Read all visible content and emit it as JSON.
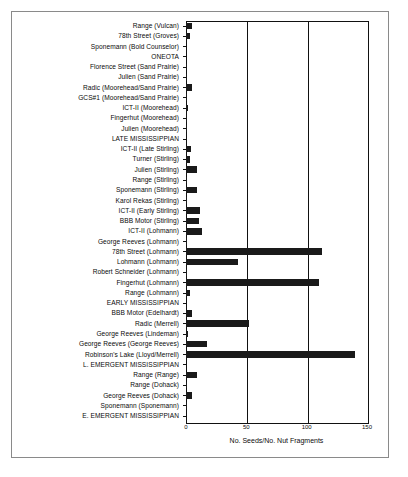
{
  "chart_data": {
    "type": "bar",
    "orientation": "horizontal",
    "title": "",
    "xlabel": "No. Seeds/No. Nut Fragments",
    "ylabel": "",
    "xlim": [
      0,
      150
    ],
    "xticks": [
      0,
      50,
      100,
      150
    ],
    "grid": true,
    "legend": null,
    "categories": [
      "Range (Vulcan)",
      "78th Street (Groves)",
      "Sponemann (Bold Counselor)",
      "ONEOTA",
      "Florence Street (Sand Prairie)",
      "Julien (Sand Prairie)",
      "Radic (Moorehead/Sand Prairie)",
      "GCS#1 (Moorehead/Sand Prairie)",
      "ICT-II (Moorehead)",
      "Fingerhut (Moorehead)",
      "Julien (Moorehead)",
      "LATE MISSISSIPPIAN",
      "ICT-II (Late Stirling)",
      "Turner (Stirling)",
      "Julien (Stirling)",
      "Range (Stirling)",
      "Sponemann (Stirling)",
      "Karol Rekas (Stirling)",
      "ICT-II (Early Stirling)",
      "BBB Motor (Stirling)",
      "ICT-II (Lohmann)",
      "George Reeves (Lohmann)",
      "78th Street (Lohmann)",
      "Lohmann (Lohmann)",
      "Robert Schneider (Lohmann)",
      "Fingerhut (Lohmann)",
      "Range (Lohmann)",
      "EARLY MISSISSIPPIAN",
      "BBB Motor (Edelhardt)",
      "Radic (Merrell)",
      "George Reeves (Lindeman)",
      "George Reeves (George Reeves)",
      "Robinson's Lake (Lloyd/Merrell)",
      "L. EMERGENT MISSISSIPPIAN",
      "Range (Range)",
      "Range (Dohack)",
      "George Reeves (Dohack)",
      "Sponemann (Sponemann)",
      "E. EMERGENT MISSISSIPPIAN"
    ],
    "values": [
      5,
      3,
      0,
      0,
      1,
      1,
      5,
      1,
      2,
      1,
      1,
      0,
      4,
      3,
      9,
      1,
      9,
      1,
      12,
      11,
      13,
      1,
      113,
      43,
      1,
      110,
      3,
      0,
      5,
      52,
      2,
      17,
      140,
      0,
      9,
      1,
      5,
      1,
      0
    ]
  },
  "colors": {
    "bar": "#1a1a1a",
    "axis": "#111111",
    "frame": "#8a8a8a",
    "background": "#ffffff",
    "text": "#0b0b0b"
  }
}
